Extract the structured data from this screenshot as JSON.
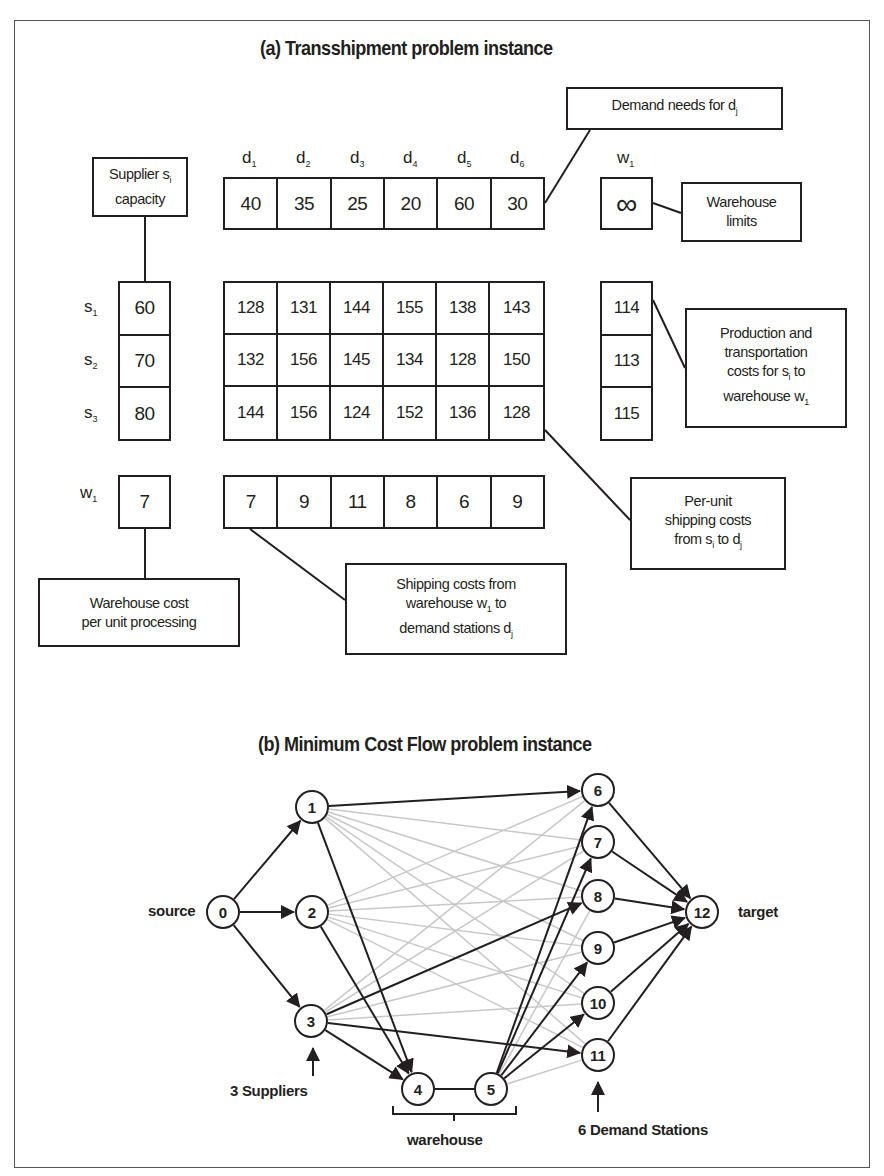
{
  "panel_a": {
    "title": "(a) Transshipment problem instance",
    "demand_labels": [
      {
        "base": "d",
        "sub": "1"
      },
      {
        "base": "d",
        "sub": "2"
      },
      {
        "base": "d",
        "sub": "3"
      },
      {
        "base": "d",
        "sub": "4"
      },
      {
        "base": "d",
        "sub": "5"
      },
      {
        "base": "d",
        "sub": "6"
      }
    ],
    "demand_values": [
      "40",
      "35",
      "25",
      "20",
      "60",
      "30"
    ],
    "warehouse_label": {
      "base": "w",
      "sub": "1"
    },
    "warehouse_limit": "∞",
    "supplier_labels": [
      {
        "base": "s",
        "sub": "1"
      },
      {
        "base": "s",
        "sub": "2"
      },
      {
        "base": "s",
        "sub": "3"
      }
    ],
    "supplier_capacity": [
      "60",
      "70",
      "80"
    ],
    "shipping_costs_supplier_to_demand": [
      [
        "128",
        "131",
        "144",
        "155",
        "138",
        "143"
      ],
      [
        "132",
        "156",
        "145",
        "134",
        "128",
        "150"
      ],
      [
        "144",
        "156",
        "124",
        "152",
        "136",
        "128"
      ]
    ],
    "supplier_to_warehouse_costs": [
      "114",
      "113",
      "115"
    ],
    "warehouse_row_label": {
      "base": "w",
      "sub": "1"
    },
    "warehouse_processing_cost": "7",
    "warehouse_to_demand_costs": [
      "7",
      "9",
      "11",
      "8",
      "6",
      "9"
    ],
    "callouts": {
      "supplier_capacity": {
        "line1": "Supplier s",
        "sub1": "i",
        "line2": "capacity"
      },
      "demand_needs": {
        "text": "Demand needs for d",
        "sub": "j"
      },
      "warehouse_limits": {
        "line1": "Warehouse",
        "line2": "limits"
      },
      "production_costs": {
        "line1": "Production and",
        "line2": "transportation",
        "line3a": "costs for s",
        "line3sub": "i",
        "line3b": " to",
        "line4a": "warehouse w",
        "line4sub": "1"
      },
      "per_unit_costs": {
        "line1": "Per-unit",
        "line2": "shipping costs",
        "line3a": "from s",
        "line3sub": "i",
        "line3b": " to d",
        "line3sub2": "j"
      },
      "shipping_from_warehouse": {
        "line1": "Shipping costs from",
        "line2a": "warehouse w",
        "line2sub": "1",
        "line2b": " to",
        "line3a": "demand stations d",
        "line3sub": "j"
      },
      "warehouse_cost": {
        "line1": "Warehouse cost",
        "line2": "per unit processing"
      }
    }
  },
  "panel_b": {
    "title": "(b) Minimum Cost Flow problem instance",
    "nodes": [
      {
        "id": "0",
        "x": 223,
        "y": 912
      },
      {
        "id": "1",
        "x": 312,
        "y": 807
      },
      {
        "id": "2",
        "x": 312,
        "y": 912
      },
      {
        "id": "3",
        "x": 311,
        "y": 1021
      },
      {
        "id": "4",
        "x": 418,
        "y": 1089
      },
      {
        "id": "5",
        "x": 491,
        "y": 1089
      },
      {
        "id": "6",
        "x": 598,
        "y": 790
      },
      {
        "id": "7",
        "x": 598,
        "y": 842
      },
      {
        "id": "8",
        "x": 598,
        "y": 896
      },
      {
        "id": "9",
        "x": 598,
        "y": 948
      },
      {
        "id": "10",
        "x": 598,
        "y": 1003
      },
      {
        "id": "11",
        "x": 598,
        "y": 1055
      },
      {
        "id": "12",
        "x": 702,
        "y": 912
      }
    ],
    "dark_edges": [
      [
        "0",
        "1"
      ],
      [
        "0",
        "2"
      ],
      [
        "0",
        "3"
      ],
      [
        "1",
        "6"
      ],
      [
        "1",
        "4"
      ],
      [
        "2",
        "4"
      ],
      [
        "3",
        "4"
      ],
      [
        "3",
        "8"
      ],
      [
        "3",
        "11"
      ],
      [
        "5",
        "6"
      ],
      [
        "5",
        "7"
      ],
      [
        "5",
        "9"
      ],
      [
        "5",
        "10"
      ],
      [
        "6",
        "12"
      ],
      [
        "7",
        "12"
      ],
      [
        "8",
        "12"
      ],
      [
        "9",
        "12"
      ],
      [
        "10",
        "12"
      ],
      [
        "11",
        "12"
      ]
    ],
    "undirected_edges": [
      [
        "4",
        "5"
      ]
    ],
    "light_edges_note": "all remaining supplier (1,2,3) and warehouse node 5 to demand (6-11) connections drawn in light gray",
    "labels": {
      "source": "source",
      "target": "target",
      "suppliers": "3 Suppliers",
      "warehouse": "warehouse",
      "demand_stations": "6 Demand Stations"
    },
    "colors": {
      "dark_edge": "#231f20",
      "light_edge": "#c8c8c8"
    }
  }
}
